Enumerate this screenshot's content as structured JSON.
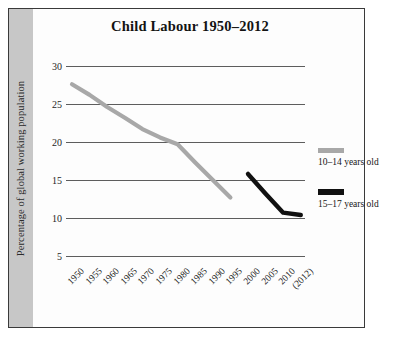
{
  "chart_data": {
    "type": "line",
    "title": "Child Labour 1950–2012",
    "xlabel": "",
    "ylabel": "Percentage of global working population",
    "ylim": [
      5,
      30
    ],
    "yticks": [
      30,
      25,
      20,
      15,
      10,
      5
    ],
    "grid": true,
    "legend_position": "right",
    "categories": [
      "1950",
      "1955",
      "1960",
      "1965",
      "1970",
      "1975",
      "1980",
      "1985",
      "1990",
      "1995",
      "2000",
      "2005",
      "2010",
      "(2012)"
    ],
    "series": [
      {
        "name": "10–14 years old",
        "color": "#a8a8a8",
        "x": [
          "1950",
          "1955",
          "1960",
          "1965",
          "1970",
          "1975",
          "1980",
          "1985",
          "1990",
          "1995"
        ],
        "values": [
          27.6,
          26.2,
          24.6,
          23.2,
          21.7,
          20.6,
          19.7,
          17.3,
          15.0,
          12.7
        ]
      },
      {
        "name": "15–17 years old",
        "color": "#111111",
        "x": [
          "2000",
          "2005",
          "2010",
          "(2012)"
        ],
        "values": [
          15.8,
          13.2,
          10.7,
          10.4
        ]
      }
    ]
  },
  "axis": {
    "y_title": "Percentage of global working population",
    "y_tick_labels": [
      "30",
      "25",
      "20",
      "15",
      "10",
      "5"
    ],
    "x_tick_labels": [
      "1950",
      "1955",
      "1960",
      "1965",
      "1970",
      "1975",
      "1980",
      "1985",
      "1990",
      "1995",
      "2000",
      "2005",
      "2010",
      "(2012)"
    ]
  },
  "legend": {
    "entries": [
      {
        "label": "10–14 years old",
        "color": "#a8a8a8"
      },
      {
        "label": "15–17 years old",
        "color": "#111111"
      }
    ]
  },
  "colors": {
    "series_10_14": "#a8a8a8",
    "series_15_17": "#111111",
    "gridline": "#5d5d5d",
    "frame": "#3a3a3a",
    "band": "#c7c7c7"
  }
}
